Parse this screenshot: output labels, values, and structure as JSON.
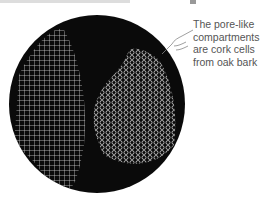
{
  "figure": {
    "caption": "The pore-like compartments are cork cells from oak bark",
    "icons": {
      "pointer": "pointing-hand-icon"
    },
    "colors": {
      "background": "#ffffff",
      "field": "#0a0a0a",
      "cells": "#d8d8d8",
      "caption": "#555555"
    }
  }
}
